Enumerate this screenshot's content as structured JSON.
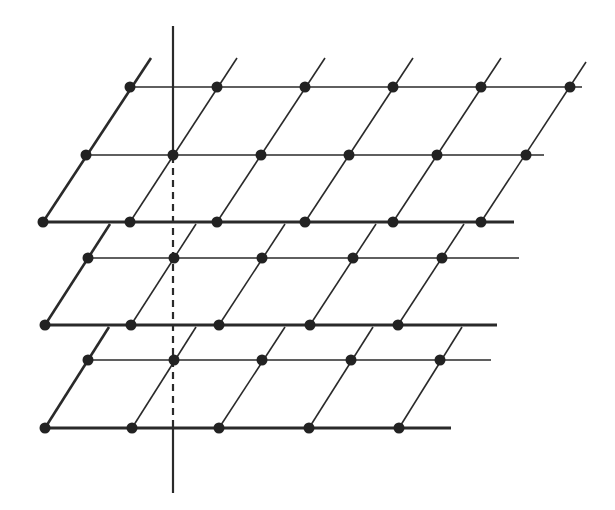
{
  "diagram": {
    "colors": {
      "line": "#2a2a2a",
      "dot": "#222222",
      "background": "#ffffff"
    },
    "dot_radius": 5.5,
    "axis": {
      "x": 173,
      "y_top": 26,
      "y_dash_start": 156,
      "y_dash_end": 428,
      "y_bottom": 493
    },
    "layers": [
      {
        "name": "top",
        "rows": [
          {
            "y": 87,
            "x_start": 130,
            "x_end": 582,
            "thick": false,
            "dots": [
              130,
              217,
              305,
              393,
              481,
              570
            ]
          },
          {
            "y": 155,
            "x_start": 86,
            "x_end": 544,
            "thick": false,
            "dots": [
              86,
              173,
              261,
              349,
              437,
              526
            ]
          },
          {
            "y": 222,
            "x_start": 43,
            "x_end": 514,
            "thick": true,
            "dots": [
              43,
              130,
              217,
              305,
              393,
              481
            ]
          }
        ],
        "obliques": [
          {
            "x1": 43,
            "y1": 222,
            "x2": 151,
            "y2": 58,
            "thick": true
          },
          {
            "x1": 130,
            "y1": 222,
            "x2": 237,
            "y2": 58
          },
          {
            "x1": 217,
            "y1": 222,
            "x2": 325,
            "y2": 58
          },
          {
            "x1": 305,
            "y1": 222,
            "x2": 413,
            "y2": 58
          },
          {
            "x1": 393,
            "y1": 222,
            "x2": 501,
            "y2": 58
          },
          {
            "x1": 481,
            "y1": 222,
            "x2": 586,
            "y2": 62
          }
        ]
      },
      {
        "name": "middle",
        "rows": [
          {
            "y": 258,
            "x_start": 88,
            "x_end": 519,
            "thick": false,
            "dots": [
              88,
              174,
              262,
              353,
              442
            ]
          },
          {
            "y": 325,
            "x_start": 45,
            "x_end": 497,
            "thick": true,
            "dots": [
              45,
              131,
              219,
              310,
              398
            ]
          }
        ],
        "obliques": [
          {
            "x1": 45,
            "y1": 325,
            "x2": 110,
            "y2": 224,
            "thick": true
          },
          {
            "x1": 131,
            "y1": 325,
            "x2": 196,
            "y2": 224
          },
          {
            "x1": 219,
            "y1": 325,
            "x2": 285,
            "y2": 224
          },
          {
            "x1": 310,
            "y1": 325,
            "x2": 376,
            "y2": 224
          },
          {
            "x1": 398,
            "y1": 325,
            "x2": 464,
            "y2": 224
          }
        ]
      },
      {
        "name": "bottom",
        "rows": [
          {
            "y": 360,
            "x_start": 88,
            "x_end": 491,
            "thick": false,
            "dots": [
              88,
              174,
              262,
              351,
              440
            ]
          },
          {
            "y": 428,
            "x_start": 45,
            "x_end": 451,
            "thick": true,
            "dots": [
              45,
              132,
              219,
              309,
              399
            ]
          }
        ],
        "obliques": [
          {
            "x1": 45,
            "y1": 428,
            "x2": 109,
            "y2": 327,
            "thick": true
          },
          {
            "x1": 132,
            "y1": 428,
            "x2": 196,
            "y2": 327
          },
          {
            "x1": 219,
            "y1": 428,
            "x2": 285,
            "y2": 327
          },
          {
            "x1": 309,
            "y1": 428,
            "x2": 373,
            "y2": 327
          },
          {
            "x1": 399,
            "y1": 428,
            "x2": 462,
            "y2": 327
          }
        ]
      }
    ]
  }
}
